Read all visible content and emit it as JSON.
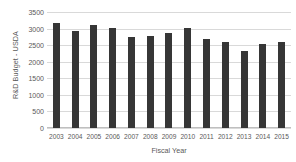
{
  "chart_data": {
    "type": "bar",
    "title": "",
    "xlabel": "Fiscal Year",
    "ylabel": "R&D Budget - USDA",
    "categories": [
      "2003",
      "2004",
      "2005",
      "2006",
      "2007",
      "2008",
      "2009",
      "2010",
      "2011",
      "2012",
      "2013",
      "2014",
      "2015"
    ],
    "values": [
      3180,
      2940,
      3100,
      3030,
      2760,
      2770,
      2860,
      3030,
      2680,
      2590,
      2310,
      2540,
      2600
    ],
    "ylim": [
      0,
      3500
    ],
    "yticks": [
      0,
      500,
      1000,
      1500,
      2000,
      2500,
      3000,
      3500
    ],
    "ytick_labels": [
      "0",
      "500",
      "1000",
      "1500",
      "2000",
      "2500",
      "3000",
      "3500"
    ],
    "grid": true,
    "legend": false,
    "legend_position": "none",
    "bar_color": "#363636",
    "gridline_color": "#D9D9D9",
    "axis_text_color": "#595959",
    "background_color": "#FFFFFF"
  }
}
